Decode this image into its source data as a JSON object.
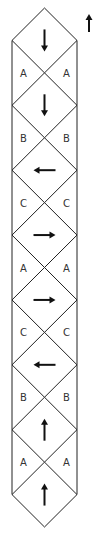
{
  "diagram": {
    "legend_arrow": "up",
    "cells": [
      {
        "arrow": "down",
        "label_below": "A"
      },
      {
        "arrow": "down",
        "label_below": "B"
      },
      {
        "arrow": "left",
        "label_below": "C"
      },
      {
        "arrow": "right",
        "label_below": "A"
      },
      {
        "arrow": "right",
        "label_below": "C"
      },
      {
        "arrow": "left",
        "label_below": "B"
      },
      {
        "arrow": "up",
        "label_below": "A"
      },
      {
        "arrow": "up",
        "label_below": null
      }
    ],
    "colors": {
      "line": "#222222",
      "label": "#333333"
    }
  }
}
